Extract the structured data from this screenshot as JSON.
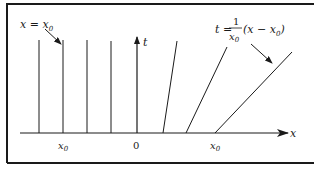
{
  "diagram": {
    "axes": {
      "x_label": "x",
      "t_label": "t"
    },
    "tick_labels": {
      "neg_x0": "x",
      "neg_x0_sub": "0",
      "origin": "0",
      "pos_x0": "x",
      "pos_x0_sub": "0"
    },
    "annotations": {
      "vertical_lines_label": "x = x",
      "vertical_lines_label_sub": "0",
      "slanted_lines_label": {
        "lhs": "t =",
        "numerator": "1",
        "denominator": "x",
        "denominator_sub": "0",
        "rhs_open": "(x − x",
        "rhs_sub": "0",
        "rhs_close": ")"
      }
    },
    "colors": {
      "line": "#1a1a1a",
      "frame": "#1a1a1a",
      "background": "#ffffff"
    }
  }
}
